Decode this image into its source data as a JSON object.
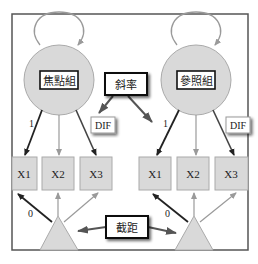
{
  "diagram": {
    "type": "measurement-invariance-DIF-model",
    "groups": [
      {
        "id": "focal",
        "label": "焦點組",
        "indicators": [
          "X1",
          "X2",
          "X3"
        ],
        "loading_label": "1",
        "intercept_label": "0",
        "dif_label": "DIF"
      },
      {
        "id": "reference",
        "label": "參照組",
        "indicators": [
          "X1",
          "X2",
          "X3"
        ],
        "loading_label": "1",
        "intercept_label": "0",
        "dif_label": "DIF"
      }
    ],
    "callouts": {
      "slope": "斜率",
      "intercept": "截距"
    }
  },
  "colors": {
    "frame": "#555555",
    "node_fill": "#d9d9d9",
    "node_stroke": "#a0a0a0",
    "bold_arrow": "#222222",
    "light_arrow": "#9a9a9a",
    "callout_border": "#111111"
  }
}
